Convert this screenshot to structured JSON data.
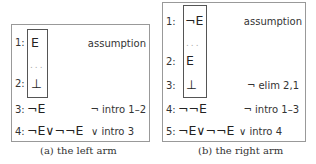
{
  "left": {
    "caption": "(a) the left arm",
    "lines": [
      {
        "num": "1:",
        "formula": "E",
        "just": "assumption"
      },
      {
        "num": "",
        "formula": "...",
        "just": ""
      },
      {
        "num": "2:",
        "formula": "⊥",
        "just": ""
      },
      {
        "num": "3:",
        "formula": "¬E",
        "just": "¬ intro 1–2"
      },
      {
        "num": "4:",
        "formula": "¬E∨¬¬E",
        "just": "∨ intro 3"
      }
    ]
  },
  "right": {
    "caption": "(b) the right arm",
    "lines": [
      {
        "num": "1:",
        "formula": "¬E",
        "just": "assumption"
      },
      {
        "num": "",
        "formula": "...",
        "just": ""
      },
      {
        "num": "2:",
        "formula": "E",
        "just": ""
      },
      {
        "num": "3:",
        "formula": "⊥",
        "just": "¬ elim 2,1"
      },
      {
        "num": "4:",
        "formula": "¬¬E",
        "just": "¬ intro 1–3"
      },
      {
        "num": "5:",
        "formula": "¬E∨¬¬E",
        "just": "∨ intro 4"
      }
    ]
  }
}
